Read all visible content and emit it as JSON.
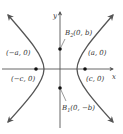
{
  "figure": {
    "axes": {
      "x_label": "x",
      "y_label": "y"
    },
    "points": [
      {
        "id": "vertex-left",
        "label": "(−a, 0)"
      },
      {
        "id": "vertex-right",
        "label": "(a, 0)"
      },
      {
        "id": "focus-left",
        "label": "(−c, 0)"
      },
      {
        "id": "focus-right",
        "label": "(c, 0)"
      },
      {
        "id": "b2",
        "name": "B",
        "subscript": "2",
        "label": "(0, b)"
      },
      {
        "id": "b1",
        "name": "B",
        "subscript": "1",
        "label": "(0, −b)"
      }
    ],
    "colors": {
      "curve": "#555555",
      "axes": "#555555",
      "points": "#111111",
      "text": "#333333"
    }
  }
}
